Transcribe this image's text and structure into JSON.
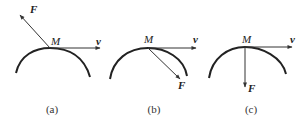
{
  "figure": {
    "panels": [
      {
        "id": "a",
        "caption": "(a)",
        "point_label": "M",
        "velocity_label": "v",
        "force_label": "F",
        "force_direction": "up-left (away from curve)"
      },
      {
        "id": "b",
        "caption": "(b)",
        "point_label": "M",
        "velocity_label": "v",
        "force_label": "F",
        "force_direction": "down-right (into curve, oblique)"
      },
      {
        "id": "c",
        "caption": "(c)",
        "point_label": "M",
        "velocity_label": "v",
        "force_label": "F",
        "force_direction": "straight down (normal to curve)"
      }
    ]
  }
}
